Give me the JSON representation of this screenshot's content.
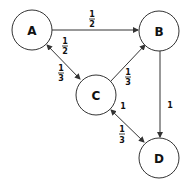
{
  "nodes": [
    {
      "id": "A",
      "label": "A"
    },
    {
      "id": "B",
      "label": "B"
    },
    {
      "id": "C",
      "label": "C"
    },
    {
      "id": "D",
      "label": "D"
    }
  ],
  "edges": [
    {
      "from": "A",
      "to": "B",
      "weight_num": "1",
      "weight_den": "2",
      "direction": "A->B"
    },
    {
      "from": "A",
      "to": "C",
      "weight_num": "1",
      "weight_den": "2",
      "direction": "A->C",
      "note": "bidirectional"
    },
    {
      "from": "C",
      "to": "A",
      "weight_num": "1",
      "weight_den": "3",
      "direction": "C->A"
    },
    {
      "from": "C",
      "to": "B",
      "weight_num": "1",
      "weight_den": "3",
      "direction": "C->B"
    },
    {
      "from": "B",
      "to": "D",
      "weight": "1",
      "direction": "B->D"
    },
    {
      "from": "D",
      "to": "C",
      "weight": "1",
      "direction": "D->C"
    },
    {
      "from": "C",
      "to": "D",
      "weight_num": "1",
      "weight_den": "3",
      "direction": "C->D"
    }
  ],
  "labels": {
    "ab": {
      "num": "1",
      "den": "2"
    },
    "ac": {
      "num": "1",
      "den": "2"
    },
    "ca": {
      "num": "1",
      "den": "3"
    },
    "cb": {
      "num": "1",
      "den": "3"
    },
    "bd": "1",
    "dc": "1",
    "cd": {
      "num": "1",
      "den": "3"
    }
  }
}
